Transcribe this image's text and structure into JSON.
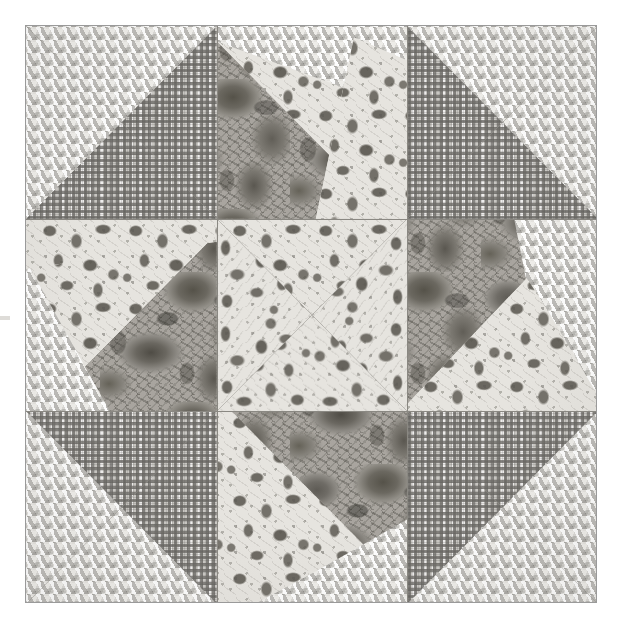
{
  "artwork": {
    "kind": "quilt-block-photograph",
    "title": "Pieced quilt block",
    "pattern_name": "Star pinwheel quilt block",
    "grid": {
      "rows": 3,
      "cols": 3
    },
    "image_size": {
      "width": 618,
      "height": 624
    },
    "block_bounds": {
      "left": 25,
      "top": 25,
      "width": 572,
      "height": 578
    },
    "palette": {
      "page_background": "#ffffff",
      "block_border": "#9a9a9a",
      "cube_light": "#e8e6e1",
      "cube_shadow": "#96948f",
      "check_ground": "#c9c7c3",
      "check_line": "#6c6a66",
      "rose_dark": "#55524b",
      "rose_mid": "#9d9a94",
      "light_floral_ground": "#e3e1dc",
      "light_floral_motif": "#6c6962",
      "seam_line": "#8a8882"
    },
    "fabrics": [
      {
        "id": "cube",
        "label": "Tumbling-blocks geometric print",
        "tone": "light"
      },
      {
        "id": "check",
        "label": "Small gingham check",
        "tone": "medium"
      },
      {
        "id": "rose",
        "label": "Large-scale dark rose floral",
        "tone": "dark"
      },
      {
        "id": "lightfloral",
        "label": "Light-ground small floral toile",
        "tone": "light"
      }
    ]
  },
  "cells": [
    {
      "index": 0,
      "position": "top-left",
      "name": "half-square-triangle",
      "patches": [
        {
          "fabric": "cube",
          "shape": "upper-left-triangle"
        },
        {
          "fabric": "check",
          "shape": "lower-right-triangle"
        }
      ]
    },
    {
      "index": 1,
      "position": "top-center",
      "name": "star-point-north",
      "patches": [
        {
          "fabric": "cube",
          "shape": "upper-left-corner-wedge"
        },
        {
          "fabric": "rose",
          "shape": "lower-left-triangle"
        },
        {
          "fabric": "lightfloral",
          "shape": "right-triangle"
        }
      ]
    },
    {
      "index": 2,
      "position": "top-right",
      "name": "half-square-triangle",
      "patches": [
        {
          "fabric": "cube",
          "shape": "upper-right-triangle"
        },
        {
          "fabric": "check",
          "shape": "lower-left-triangle"
        }
      ]
    },
    {
      "index": 3,
      "position": "middle-left",
      "name": "star-point-west",
      "patches": [
        {
          "fabric": "cube",
          "shape": "lower-left-corner-wedge"
        },
        {
          "fabric": "rose",
          "shape": "lower-right-triangle"
        },
        {
          "fabric": "lightfloral",
          "shape": "upper-triangle"
        }
      ]
    },
    {
      "index": 4,
      "position": "center",
      "name": "pinwheel-center",
      "patches": [
        {
          "fabric": "lightfloral",
          "shape": "quarter-triangle-top"
        },
        {
          "fabric": "lightfloral",
          "shape": "quarter-triangle-right"
        },
        {
          "fabric": "lightfloral",
          "shape": "quarter-triangle-bottom"
        },
        {
          "fabric": "lightfloral",
          "shape": "quarter-triangle-left"
        }
      ]
    },
    {
      "index": 5,
      "position": "middle-right",
      "name": "star-point-east",
      "patches": [
        {
          "fabric": "cube",
          "shape": "upper-right-corner-wedge"
        },
        {
          "fabric": "rose",
          "shape": "upper-left-triangle"
        },
        {
          "fabric": "lightfloral",
          "shape": "lower-triangle"
        }
      ]
    },
    {
      "index": 6,
      "position": "bottom-left",
      "name": "half-square-triangle",
      "patches": [
        {
          "fabric": "cube",
          "shape": "lower-left-triangle"
        },
        {
          "fabric": "check",
          "shape": "upper-right-triangle"
        }
      ]
    },
    {
      "index": 7,
      "position": "bottom-center",
      "name": "star-point-south",
      "patches": [
        {
          "fabric": "cube",
          "shape": "lower-right-corner-wedge"
        },
        {
          "fabric": "rose",
          "shape": "upper-right-triangle"
        },
        {
          "fabric": "lightfloral",
          "shape": "left-triangle"
        }
      ]
    },
    {
      "index": 8,
      "position": "bottom-right",
      "name": "half-square-triangle",
      "patches": [
        {
          "fabric": "cube",
          "shape": "lower-right-triangle"
        },
        {
          "fabric": "check",
          "shape": "upper-left-triangle"
        }
      ]
    }
  ]
}
